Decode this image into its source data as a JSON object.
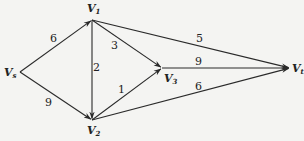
{
  "diagram": {
    "type": "directed-weighted-graph",
    "nodes": [
      {
        "id": "s",
        "label": "V",
        "sub": "s",
        "x": 20,
        "y": 72,
        "lx": 4,
        "ly": 76
      },
      {
        "id": "1",
        "label": "V",
        "sub": "1",
        "x": 92,
        "y": 20,
        "lx": 87,
        "ly": 12
      },
      {
        "id": "2",
        "label": "V",
        "sub": "2",
        "x": 92,
        "y": 120,
        "lx": 87,
        "ly": 134
      },
      {
        "id": "3",
        "label": "V",
        "sub": "3",
        "x": 162,
        "y": 68,
        "lx": 164,
        "ly": 82
      },
      {
        "id": "t",
        "label": "V",
        "sub": "t",
        "x": 290,
        "y": 68,
        "lx": 292,
        "ly": 72
      }
    ],
    "edges": [
      {
        "from": "s",
        "to": "1",
        "weight": "6",
        "lx": 50,
        "ly": 42
      },
      {
        "from": "s",
        "to": "2",
        "weight": "9",
        "lx": 45,
        "ly": 106
      },
      {
        "from": "1",
        "to": "2",
        "weight": "2",
        "lx": 93,
        "ly": 71
      },
      {
        "from": "1",
        "to": "3",
        "weight": "3",
        "lx": 111,
        "ly": 49
      },
      {
        "from": "1",
        "to": "t",
        "weight": "5",
        "lx": 196,
        "ly": 42
      },
      {
        "from": "2",
        "to": "3",
        "weight": "1",
        "lx": 118,
        "ly": 93
      },
      {
        "from": "3",
        "to": "t",
        "weight": "9",
        "lx": 195,
        "ly": 65
      },
      {
        "from": "2",
        "to": "t",
        "weight": "6",
        "lx": 195,
        "ly": 90
      }
    ],
    "colors": {
      "stroke": "#2a2a2a",
      "background": "#f4f4f2"
    }
  }
}
